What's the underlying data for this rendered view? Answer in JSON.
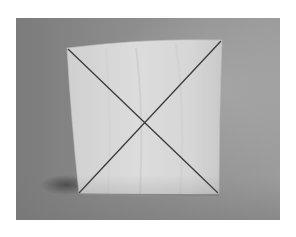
{
  "image": {
    "description": "Grayscale photograph of a standing square sheet of paper with an X drawn corner to corner",
    "subject": "paper-square-with-diagonal-cross",
    "colors": {
      "frame": "#ffffff",
      "background_left": "#7b7b7b",
      "background_right": "#9c9c9c",
      "paper": "#d4d4d4",
      "paper_highlight": "#e0e0e0",
      "line": "#3a3a3a",
      "shadow": "#4a4a4a"
    }
  }
}
